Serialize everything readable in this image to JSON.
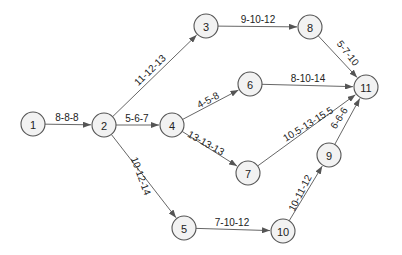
{
  "diagram": {
    "type": "activity-on-arrow network",
    "node_radius": 12,
    "colors": {
      "node_fill": "#f2f2f2",
      "node_stroke": "#555555",
      "edge": "#555555",
      "text": "#222222"
    },
    "nodes": [
      {
        "id": "1",
        "label": "1",
        "x": 33,
        "y": 124
      },
      {
        "id": "2",
        "label": "2",
        "x": 104,
        "y": 125
      },
      {
        "id": "3",
        "label": "3",
        "x": 206,
        "y": 26
      },
      {
        "id": "4",
        "label": "4",
        "x": 172,
        "y": 125
      },
      {
        "id": "5",
        "label": "5",
        "x": 184,
        "y": 228
      },
      {
        "id": "6",
        "label": "6",
        "x": 250,
        "y": 84
      },
      {
        "id": "7",
        "label": "7",
        "x": 248,
        "y": 173
      },
      {
        "id": "8",
        "label": "8",
        "x": 310,
        "y": 27
      },
      {
        "id": "9",
        "label": "9",
        "x": 329,
        "y": 155
      },
      {
        "id": "10",
        "label": "10",
        "x": 283,
        "y": 231
      },
      {
        "id": "11",
        "label": "11",
        "x": 366,
        "y": 87
      }
    ],
    "edges": [
      {
        "from": "1",
        "to": "2",
        "label": "8-8-8",
        "lx": 67,
        "ly": 117,
        "rot": 0
      },
      {
        "from": "2",
        "to": "3",
        "label": "11-12-13",
        "lx": 150,
        "ly": 70,
        "rot": -44
      },
      {
        "from": "2",
        "to": "4",
        "label": "5-6-7",
        "lx": 137,
        "ly": 118,
        "rot": 0
      },
      {
        "from": "2",
        "to": "5",
        "label": "10-12-14",
        "lx": 141,
        "ly": 176,
        "rot": 70
      },
      {
        "from": "3",
        "to": "8",
        "label": "9-10-12",
        "lx": 258,
        "ly": 19,
        "rot": 0
      },
      {
        "from": "4",
        "to": "6",
        "label": "4-5-8",
        "lx": 208,
        "ly": 100,
        "rot": -28
      },
      {
        "from": "4",
        "to": "7",
        "label": "13-13-13",
        "lx": 206,
        "ly": 143,
        "rot": 29
      },
      {
        "from": "5",
        "to": "10",
        "label": "7-10-12",
        "lx": 232,
        "ly": 222,
        "rot": 0
      },
      {
        "from": "6",
        "to": "11",
        "label": "8-10-14",
        "lx": 308,
        "ly": 78,
        "rot": 0
      },
      {
        "from": "7",
        "to": "11",
        "label": "10.5-13-15.5",
        "lx": 308,
        "ly": 124,
        "rot": -32
      },
      {
        "from": "8",
        "to": "11",
        "label": "5-7-10",
        "lx": 348,
        "ly": 53,
        "rot": 52
      },
      {
        "from": "9",
        "to": "11",
        "label": "6-6-6",
        "lx": 339,
        "ly": 118,
        "rot": -58
      },
      {
        "from": "10",
        "to": "9",
        "label": "10-11-12",
        "lx": 300,
        "ly": 193,
        "rot": -63
      }
    ]
  }
}
